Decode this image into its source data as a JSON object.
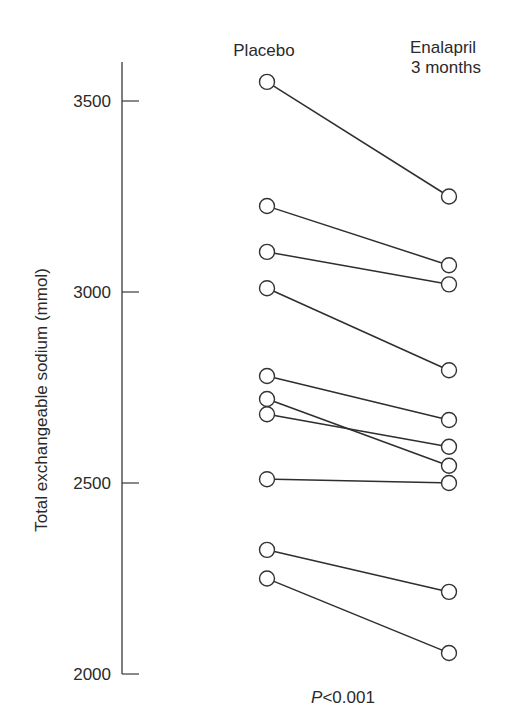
{
  "chart_data": {
    "type": "line",
    "subtype": "paired-dot (slope) plot",
    "title": "",
    "xlabel": "",
    "ylabel": "Total exchangeable sodium (mmol)",
    "ylim": [
      2000,
      3600
    ],
    "yticks": [
      2000,
      2500,
      3000,
      3500
    ],
    "ytick_labels": [
      "2000",
      "2500",
      "3000",
      "3500"
    ],
    "grid": false,
    "categories": [
      "Placebo",
      "Enalapril\n3 months"
    ],
    "category_labels": [
      {
        "lines": [
          "Placebo"
        ]
      },
      {
        "lines": [
          "Enalapril",
          "3 months"
        ]
      }
    ],
    "series": [
      {
        "name": "patient-1",
        "values": [
          3550,
          3250
        ]
      },
      {
        "name": "patient-2",
        "values": [
          3225,
          3070
        ]
      },
      {
        "name": "patient-3",
        "values": [
          3105,
          3020
        ]
      },
      {
        "name": "patient-4",
        "values": [
          3010,
          2795
        ]
      },
      {
        "name": "patient-5",
        "values": [
          2780,
          2665
        ]
      },
      {
        "name": "patient-6",
        "values": [
          2720,
          2545
        ]
      },
      {
        "name": "patient-7",
        "values": [
          2680,
          2595
        ]
      },
      {
        "name": "patient-8",
        "values": [
          2510,
          2500
        ]
      },
      {
        "name": "patient-9",
        "values": [
          2325,
          2215
        ]
      },
      {
        "name": "patient-10",
        "values": [
          2250,
          2055
        ]
      }
    ],
    "annotations": [
      {
        "text_italic": "P",
        "text": "<0.001",
        "placement": "bottom-center"
      }
    ],
    "colors": {
      "line": "#2e2e2e",
      "marker_fill": "#ffffff",
      "marker_stroke": "#333333"
    }
  }
}
